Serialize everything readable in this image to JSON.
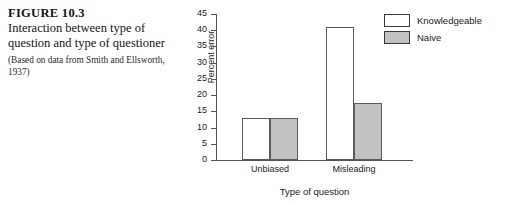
{
  "caption": {
    "figure_number": "FIGURE 10.3",
    "title": "Interaction between type of question and type of questioner",
    "source": "(Based on data from Smith and Ellsworth, 1937)"
  },
  "chart_data": {
    "type": "bar",
    "title": "",
    "xlabel": "Type of question",
    "ylabel": "Percent error",
    "categories": [
      "Unbiased",
      "Misleading"
    ],
    "series": [
      {
        "name": "Knowledgeable",
        "values": [
          13,
          41
        ],
        "color": "#ffffff"
      },
      {
        "name": "Naive",
        "values": [
          13,
          17.5
        ],
        "color": "#c2c2c2"
      }
    ],
    "ylim": [
      0,
      45
    ],
    "ytick_values": [
      0,
      5,
      10,
      15,
      20,
      25,
      30,
      35,
      40,
      45
    ],
    "yticks": [
      "0",
      "5",
      "10",
      "15",
      "20",
      "25",
      "30",
      "35",
      "40",
      "45"
    ],
    "grid": false,
    "legend_position": "top-right"
  }
}
